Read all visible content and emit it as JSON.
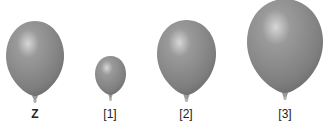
{
  "balloons": [
    {
      "id": "Z",
      "label": "Z",
      "bold": true
    },
    {
      "id": "1",
      "label": "[1]",
      "bold": false
    },
    {
      "id": "2",
      "label": "[2]",
      "bold": false
    },
    {
      "id": "3",
      "label": "[3]",
      "bold": false
    }
  ],
  "colors": {
    "balloon": "#8a8a8a",
    "highlight": "#d8d8d8",
    "shade": "#6a6a6a"
  }
}
